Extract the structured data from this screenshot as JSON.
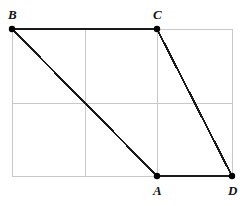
{
  "figure": {
    "type": "geometry-diagram",
    "canvas": {
      "width": 251,
      "height": 206
    },
    "background_color": "#ffffff",
    "grid": {
      "color": "#c8c8c8",
      "stroke_width": 1,
      "left": 12,
      "top": 29,
      "right": 232,
      "bottom": 176,
      "vertical_lines": [
        12,
        85,
        157,
        232
      ],
      "horizontal_lines": [
        29,
        103,
        176
      ]
    },
    "shape": {
      "stroke_color": "#1a1a1a",
      "stroke_width": 2,
      "outline_order": [
        "B",
        "C",
        "D",
        "A"
      ],
      "diagonal": [
        "B",
        "A"
      ]
    },
    "point_marker": {
      "color": "#000000",
      "radius": 3.2
    },
    "points": [
      {
        "id": "A",
        "label": "A",
        "x": 157,
        "y": 176,
        "label_x": 153,
        "label_y": 184
      },
      {
        "id": "B",
        "label": "B",
        "x": 12,
        "y": 29,
        "label_x": 8,
        "label_y": 8
      },
      {
        "id": "C",
        "label": "C",
        "x": 157,
        "y": 29,
        "label_x": 153,
        "label_y": 8
      },
      {
        "id": "D",
        "label": "D",
        "x": 232,
        "y": 176,
        "label_x": 228,
        "label_y": 184
      }
    ]
  }
}
